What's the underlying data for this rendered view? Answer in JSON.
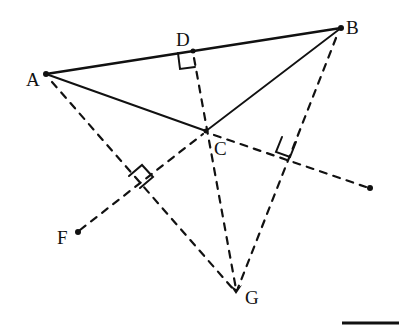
{
  "diagram": {
    "type": "geometry",
    "ink_color": "#111111",
    "background": "#ffffff",
    "points": {
      "A": {
        "label": "A",
        "x": 46,
        "y": 74
      },
      "B": {
        "label": "B",
        "x": 341,
        "y": 28
      },
      "C": {
        "label": "C",
        "x": 206,
        "y": 131
      },
      "D": {
        "label": "D",
        "x": 193,
        "y": 51
      },
      "F": {
        "label": "F",
        "x": 78,
        "y": 232
      },
      "G": {
        "label": "G",
        "x": 236,
        "y": 292
      },
      "E": {
        "label": "",
        "x": 370,
        "y": 188
      }
    },
    "solid_segments": [
      "AB",
      "AC",
      "BC"
    ],
    "dashed_segments": [
      "AG",
      "DG",
      "BG",
      "FC",
      "CE"
    ],
    "right_angle_marks": [
      "D on AB (CD ⟂ AB)",
      "on AG (FC ⟂ AG)",
      "on BG (CE ⟂ BG)"
    ],
    "scale_bar": {
      "x1": 342,
      "x2": 399,
      "y": 323
    }
  }
}
